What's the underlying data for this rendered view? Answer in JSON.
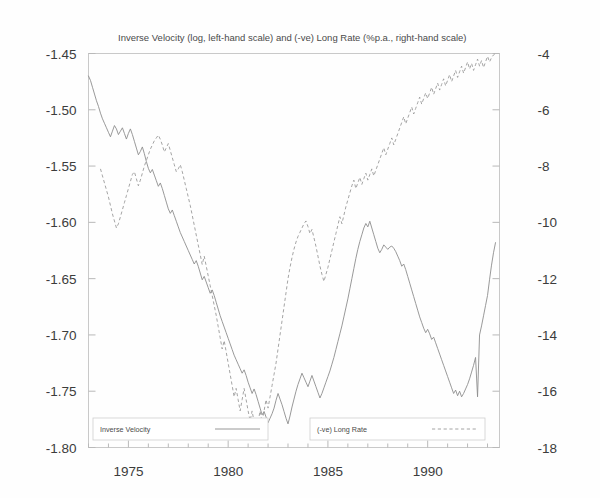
{
  "chart_data": {
    "type": "line",
    "title": "Inverse Velocity (log, left-hand scale) and (-ve) Long Rate (%p.a., right-hand scale)",
    "xlabel": "",
    "ylabel": "",
    "grid": false,
    "legend_position": "bottom",
    "xlim": [
      1973.0,
      1993.6
    ],
    "xticks_major": [
      1975,
      1980,
      1985,
      1990
    ],
    "xticks_major_labels": [
      "1975",
      "1980",
      "1985",
      "1990"
    ],
    "xticks_minor": [
      1973,
      1974,
      1976,
      1977,
      1978,
      1979,
      1981,
      1982,
      1983,
      1984,
      1986,
      1987,
      1988,
      1989,
      1991,
      1992,
      1993
    ],
    "left_axis": {
      "label": "Inverse Velocity (log)",
      "ylim": [
        -1.8,
        -1.45
      ],
      "ticks": [
        -1.45,
        -1.5,
        -1.55,
        -1.6,
        -1.65,
        -1.7,
        -1.75,
        -1.8
      ],
      "tick_labels": [
        "-1.45",
        "-1.50",
        "-1.55",
        "-1.60",
        "-1.65",
        "-1.70",
        "-1.75",
        "-1.80"
      ]
    },
    "right_axis": {
      "label": "(-ve) Long Rate (%p.a.)",
      "ylim": [
        -18,
        -4
      ],
      "ticks": [
        -4,
        -6,
        -8,
        -10,
        -12,
        -14,
        -16,
        -18
      ],
      "tick_labels": [
        "-4",
        "-6",
        "-8",
        "-10",
        "-12",
        "-14",
        "-16",
        "-18"
      ]
    },
    "series": [
      {
        "name": "Inverse Velocity",
        "axis": "left",
        "style": "solid",
        "color": "#8d8d8d",
        "x": [
          1973.0,
          1973.1,
          1973.2,
          1973.3,
          1973.4,
          1973.5,
          1973.6,
          1973.7,
          1973.8,
          1973.9,
          1974.0,
          1974.1,
          1974.2,
          1974.3,
          1974.4,
          1974.5,
          1974.6,
          1974.7,
          1974.8,
          1974.9,
          1975.0,
          1975.1,
          1975.2,
          1975.3,
          1975.4,
          1975.5,
          1975.6,
          1975.7,
          1975.8,
          1975.9,
          1976.0,
          1976.1,
          1976.2,
          1976.3,
          1976.4,
          1976.5,
          1976.6,
          1976.7,
          1976.8,
          1976.9,
          1977.0,
          1977.1,
          1977.2,
          1977.3,
          1977.4,
          1977.5,
          1977.6,
          1977.7,
          1977.8,
          1977.9,
          1978.0,
          1978.1,
          1978.2,
          1978.3,
          1978.4,
          1978.5,
          1978.6,
          1978.7,
          1978.8,
          1978.9,
          1979.0,
          1979.1,
          1979.2,
          1979.3,
          1979.4,
          1979.5,
          1979.6,
          1979.7,
          1979.8,
          1979.9,
          1980.0,
          1980.1,
          1980.2,
          1980.3,
          1980.4,
          1980.5,
          1980.6,
          1980.7,
          1980.8,
          1980.9,
          1981.0,
          1981.1,
          1981.2,
          1981.3,
          1981.4,
          1981.5,
          1981.6,
          1981.7,
          1981.8,
          1981.9,
          1982.0,
          1982.1,
          1982.2,
          1982.3,
          1982.4,
          1982.5,
          1982.6,
          1982.7,
          1982.8,
          1982.9,
          1983.0,
          1983.1,
          1983.2,
          1983.3,
          1983.4,
          1983.5,
          1983.6,
          1983.7,
          1983.8,
          1983.9,
          1984.0,
          1984.1,
          1984.2,
          1984.3,
          1984.4,
          1984.5,
          1984.6,
          1984.7,
          1984.8,
          1984.9,
          1985.0,
          1985.1,
          1985.2,
          1985.3,
          1985.4,
          1985.5,
          1985.6,
          1985.7,
          1985.8,
          1985.9,
          1986.0,
          1986.1,
          1986.2,
          1986.3,
          1986.4,
          1986.5,
          1986.6,
          1986.7,
          1986.8,
          1986.9,
          1987.0,
          1987.1,
          1987.2,
          1987.3,
          1987.4,
          1987.5,
          1987.6,
          1987.7,
          1987.8,
          1987.9,
          1988.0,
          1988.1,
          1988.2,
          1988.3,
          1988.4,
          1988.5,
          1988.6,
          1988.7,
          1988.8,
          1988.9,
          1989.0,
          1989.1,
          1989.2,
          1989.3,
          1989.4,
          1989.5,
          1989.6,
          1989.7,
          1989.8,
          1989.9,
          1990.0,
          1990.1,
          1990.2,
          1990.3,
          1990.4,
          1990.5,
          1990.6,
          1990.7,
          1990.8,
          1990.9,
          1991.0,
          1991.1,
          1991.2,
          1991.3,
          1991.4,
          1991.5,
          1991.6,
          1991.7,
          1991.8,
          1991.9,
          1992.0,
          1992.1,
          1992.2,
          1992.3,
          1992.4,
          1992.5,
          1992.6,
          1992.7,
          1992.8,
          1992.9,
          1993.0,
          1993.1,
          1993.2,
          1993.3,
          1993.4
        ],
        "y": [
          -1.47,
          -1.474,
          -1.48,
          -1.486,
          -1.492,
          -1.497,
          -1.503,
          -1.508,
          -1.512,
          -1.516,
          -1.52,
          -1.524,
          -1.519,
          -1.514,
          -1.517,
          -1.522,
          -1.519,
          -1.516,
          -1.521,
          -1.526,
          -1.521,
          -1.517,
          -1.522,
          -1.528,
          -1.534,
          -1.54,
          -1.537,
          -1.533,
          -1.539,
          -1.546,
          -1.552,
          -1.556,
          -1.553,
          -1.558,
          -1.563,
          -1.568,
          -1.565,
          -1.57,
          -1.576,
          -1.582,
          -1.588,
          -1.592,
          -1.589,
          -1.594,
          -1.599,
          -1.604,
          -1.609,
          -1.613,
          -1.617,
          -1.621,
          -1.625,
          -1.629,
          -1.633,
          -1.637,
          -1.634,
          -1.639,
          -1.645,
          -1.651,
          -1.648,
          -1.653,
          -1.658,
          -1.663,
          -1.66,
          -1.665,
          -1.671,
          -1.677,
          -1.683,
          -1.688,
          -1.693,
          -1.698,
          -1.703,
          -1.708,
          -1.713,
          -1.718,
          -1.722,
          -1.726,
          -1.73,
          -1.734,
          -1.731,
          -1.736,
          -1.742,
          -1.747,
          -1.752,
          -1.748,
          -1.753,
          -1.759,
          -1.765,
          -1.771,
          -1.768,
          -1.773,
          -1.778,
          -1.774,
          -1.77,
          -1.765,
          -1.758,
          -1.752,
          -1.757,
          -1.762,
          -1.768,
          -1.774,
          -1.779,
          -1.772,
          -1.764,
          -1.757,
          -1.75,
          -1.744,
          -1.739,
          -1.734,
          -1.738,
          -1.742,
          -1.746,
          -1.741,
          -1.736,
          -1.741,
          -1.746,
          -1.751,
          -1.756,
          -1.752,
          -1.747,
          -1.742,
          -1.737,
          -1.732,
          -1.726,
          -1.72,
          -1.713,
          -1.706,
          -1.699,
          -1.692,
          -1.684,
          -1.676,
          -1.668,
          -1.659,
          -1.65,
          -1.641,
          -1.632,
          -1.624,
          -1.617,
          -1.611,
          -1.605,
          -1.601,
          -1.604,
          -1.599,
          -1.605,
          -1.611,
          -1.617,
          -1.623,
          -1.627,
          -1.624,
          -1.62,
          -1.622,
          -1.624,
          -1.622,
          -1.621,
          -1.623,
          -1.626,
          -1.63,
          -1.634,
          -1.639,
          -1.637,
          -1.642,
          -1.648,
          -1.654,
          -1.66,
          -1.666,
          -1.672,
          -1.678,
          -1.684,
          -1.689,
          -1.694,
          -1.698,
          -1.695,
          -1.699,
          -1.704,
          -1.702,
          -1.707,
          -1.712,
          -1.717,
          -1.722,
          -1.727,
          -1.732,
          -1.737,
          -1.742,
          -1.747,
          -1.752,
          -1.749,
          -1.754,
          -1.75,
          -1.755,
          -1.752,
          -1.748,
          -1.744,
          -1.739,
          -1.733,
          -1.727,
          -1.72,
          -1.755,
          -1.7,
          -1.692,
          -1.683,
          -1.674,
          -1.665,
          -1.651,
          -1.638,
          -1.627,
          -1.618
        ]
      },
      {
        "name": "(-ve) Long Rate",
        "axis": "right",
        "style": "dashed",
        "color": "#9a9a9a",
        "x": [
          1973.6,
          1973.7,
          1973.8,
          1973.9,
          1974.0,
          1974.1,
          1974.2,
          1974.3,
          1974.4,
          1974.5,
          1974.6,
          1974.7,
          1974.8,
          1974.9,
          1975.0,
          1975.1,
          1975.2,
          1975.3,
          1975.4,
          1975.5,
          1975.6,
          1975.7,
          1975.8,
          1975.9,
          1976.0,
          1976.1,
          1976.2,
          1976.3,
          1976.4,
          1976.5,
          1976.6,
          1976.7,
          1976.8,
          1976.9,
          1977.0,
          1977.1,
          1977.2,
          1977.3,
          1977.4,
          1977.5,
          1977.6,
          1977.7,
          1977.8,
          1977.9,
          1978.0,
          1978.1,
          1978.2,
          1978.3,
          1978.4,
          1978.5,
          1978.6,
          1978.7,
          1978.8,
          1978.9,
          1979.0,
          1979.1,
          1979.2,
          1979.3,
          1979.4,
          1979.5,
          1979.6,
          1979.7,
          1979.8,
          1979.9,
          1980.0,
          1980.1,
          1980.2,
          1980.3,
          1980.4,
          1980.5,
          1980.6,
          1980.7,
          1980.8,
          1980.9,
          1981.0,
          1981.1,
          1981.2,
          1981.3,
          1981.4,
          1981.5,
          1981.6,
          1981.7,
          1981.8,
          1981.9,
          1982.0,
          1982.1,
          1982.2,
          1982.3,
          1982.4,
          1982.5,
          1982.6,
          1982.7,
          1982.8,
          1982.9,
          1983.0,
          1983.1,
          1983.2,
          1983.3,
          1983.4,
          1983.5,
          1983.6,
          1983.7,
          1983.8,
          1983.9,
          1984.0,
          1984.1,
          1984.2,
          1984.3,
          1984.4,
          1984.5,
          1984.6,
          1984.7,
          1984.8,
          1984.9,
          1985.0,
          1985.1,
          1985.2,
          1985.3,
          1985.4,
          1985.5,
          1985.6,
          1985.7,
          1985.8,
          1985.9,
          1986.0,
          1986.1,
          1986.2,
          1986.3,
          1986.4,
          1986.5,
          1986.6,
          1986.7,
          1986.8,
          1986.9,
          1987.0,
          1987.1,
          1987.2,
          1987.3,
          1987.4,
          1987.5,
          1987.6,
          1987.7,
          1987.8,
          1987.9,
          1988.0,
          1988.1,
          1988.2,
          1988.3,
          1988.4,
          1988.5,
          1988.6,
          1988.7,
          1988.8,
          1988.9,
          1989.0,
          1989.1,
          1989.2,
          1989.3,
          1989.4,
          1989.5,
          1989.6,
          1989.7,
          1989.8,
          1989.9,
          1990.0,
          1990.1,
          1990.2,
          1990.3,
          1990.4,
          1990.5,
          1990.6,
          1990.7,
          1990.8,
          1990.9,
          1991.0,
          1991.1,
          1991.2,
          1991.3,
          1991.4,
          1991.5,
          1991.6,
          1991.7,
          1991.8,
          1991.9,
          1992.0,
          1992.1,
          1992.2,
          1992.3,
          1992.4,
          1992.5,
          1992.6,
          1992.7,
          1992.8,
          1992.9,
          1993.0,
          1993.1,
          1993.2,
          1993.3,
          1993.4
        ],
        "y": [
          -8.1,
          -8.35,
          -8.6,
          -8.85,
          -9.1,
          -9.4,
          -9.7,
          -9.95,
          -10.2,
          -10.05,
          -9.8,
          -9.55,
          -9.3,
          -9.05,
          -8.8,
          -8.55,
          -8.3,
          -8.2,
          -8.45,
          -8.7,
          -8.5,
          -8.25,
          -8.0,
          -7.8,
          -7.6,
          -7.4,
          -7.25,
          -7.1,
          -7.0,
          -6.9,
          -7.05,
          -7.25,
          -7.5,
          -7.35,
          -7.2,
          -7.45,
          -7.7,
          -7.95,
          -8.2,
          -8.1,
          -7.95,
          -8.2,
          -8.5,
          -8.8,
          -9.1,
          -9.4,
          -9.75,
          -10.1,
          -10.45,
          -10.8,
          -11.15,
          -11.5,
          -11.2,
          -11.55,
          -11.9,
          -12.25,
          -12.6,
          -12.95,
          -13.3,
          -13.7,
          -14.1,
          -14.5,
          -14.2,
          -14.6,
          -15.0,
          -15.4,
          -15.8,
          -16.2,
          -15.9,
          -16.3,
          -16.7,
          -16.3,
          -15.9,
          -16.3,
          -16.7,
          -17.05,
          -16.7,
          -17.1,
          -17.45,
          -17.1,
          -16.7,
          -17.1,
          -16.7,
          -16.3,
          -16.6,
          -16.2,
          -15.8,
          -15.4,
          -15.0,
          -14.5,
          -14.0,
          -13.5,
          -13.0,
          -12.5,
          -12.0,
          -11.6,
          -11.25,
          -10.95,
          -10.7,
          -10.5,
          -10.35,
          -10.2,
          -10.05,
          -9.95,
          -10.15,
          -10.4,
          -10.25,
          -10.55,
          -10.85,
          -11.2,
          -11.55,
          -11.85,
          -12.1,
          -11.85,
          -11.6,
          -11.3,
          -11.0,
          -10.7,
          -10.4,
          -10.1,
          -9.8,
          -10.05,
          -9.75,
          -9.45,
          -9.2,
          -8.95,
          -8.7,
          -8.5,
          -8.8,
          -8.6,
          -8.4,
          -8.65,
          -8.45,
          -8.25,
          -8.5,
          -8.3,
          -8.1,
          -8.35,
          -8.15,
          -7.95,
          -7.75,
          -7.55,
          -7.35,
          -7.6,
          -7.4,
          -7.2,
          -7.0,
          -7.25,
          -7.05,
          -6.85,
          -6.65,
          -6.45,
          -6.25,
          -6.5,
          -6.3,
          -6.1,
          -5.9,
          -6.15,
          -5.95,
          -5.75,
          -5.55,
          -5.8,
          -5.6,
          -5.4,
          -5.6,
          -5.4,
          -5.2,
          -5.45,
          -5.25,
          -5.05,
          -5.3,
          -5.1,
          -4.9,
          -5.15,
          -4.95,
          -4.75,
          -5.0,
          -4.8,
          -4.6,
          -4.85,
          -4.65,
          -4.45,
          -4.7,
          -4.5,
          -4.3,
          -4.55,
          -4.35,
          -4.6,
          -4.4,
          -4.2,
          -4.45,
          -4.25,
          -4.5,
          -4.3,
          -4.1,
          -4.3,
          -4.15,
          -4.05,
          -4.0
        ]
      }
    ],
    "legend": [
      {
        "label": "Inverse Velocity",
        "style": "solid"
      },
      {
        "label": "(-ve) Long Rate",
        "style": "dashed"
      }
    ]
  }
}
